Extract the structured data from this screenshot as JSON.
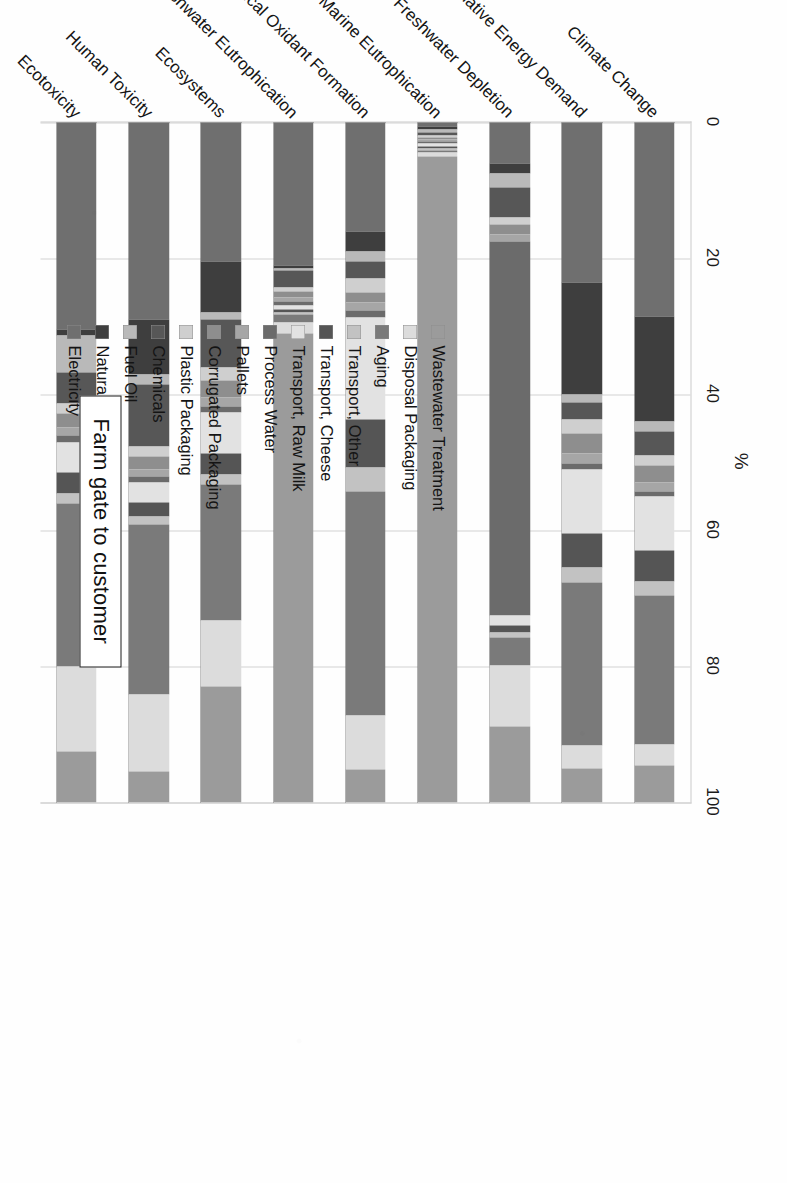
{
  "figure": {
    "title": "Farm gate to customer",
    "axis_title": "%"
  },
  "chart_data": {
    "type": "bar",
    "orientation": "horizontal",
    "stacked": true,
    "normalized_percent": true,
    "title": "Farm gate to customer",
    "xlabel": "%",
    "ylabel": "",
    "xlim": [
      0,
      100
    ],
    "grid": true,
    "legend_position": "bottom",
    "tick_labels": [
      "0",
      "20",
      "40",
      "60",
      "80",
      "100"
    ],
    "tick_values": [
      0,
      20,
      40,
      60,
      80,
      100
    ],
    "categories": [
      "Climate Change",
      "Cumulative Energy Demand",
      "Freshwater Depletion",
      "Marine Eutrophication",
      "Photochemical Oxidant Formation",
      "Freshwater Eutrophication",
      "Ecosystems",
      "Human Toxicity",
      "Ecotoxicity"
    ],
    "series": [
      {
        "name": "Electricity",
        "color": "#6f6f6f",
        "values": [
          28.5,
          23.5,
          6.0,
          0.6,
          16.0,
          21.0,
          20.5,
          29.0,
          30.5
        ]
      },
      {
        "name": "Natural Gas",
        "color": "#3e3e3e",
        "values": [
          15.5,
          16.5,
          1.5,
          0.5,
          3.0,
          0.4,
          7.5,
          8.0,
          0.8
        ]
      },
      {
        "name": "Fuel Oil",
        "color": "#b9b9b9",
        "values": [
          1.5,
          1.2,
          2.0,
          0.4,
          1.5,
          0.3,
          1.0,
          1.6,
          5.5
        ]
      },
      {
        "name": "Chemicals",
        "color": "#575757",
        "values": [
          3.5,
          2.5,
          4.5,
          0.4,
          2.5,
          2.6,
          7.0,
          9.0,
          4.5
        ]
      },
      {
        "name": "Plastic Packaging",
        "color": "#cfcfcf",
        "values": [
          1.5,
          2.0,
          1.0,
          0.3,
          2.0,
          0.5,
          2.0,
          1.5,
          1.5
        ]
      },
      {
        "name": "Corrugated Packaging",
        "color": "#8e8e8e",
        "values": [
          2.5,
          3.0,
          1.5,
          0.3,
          1.5,
          1.0,
          2.5,
          2.0,
          2.0
        ]
      },
      {
        "name": "Pallets",
        "color": "#a6a6a6",
        "values": [
          1.2,
          1.5,
          1.0,
          0.3,
          1.2,
          0.6,
          1.2,
          1.0,
          1.2
        ]
      },
      {
        "name": "Process Water",
        "color": "#6b6b6b",
        "values": [
          0.8,
          0.8,
          55.0,
          0.3,
          1.0,
          0.5,
          1.0,
          0.8,
          1.0
        ]
      },
      {
        "name": "Transport, Raw Milk",
        "color": "#e2e2e2",
        "values": [
          8.0,
          9.5,
          1.5,
          0.4,
          15.0,
          0.6,
          6.0,
          3.0,
          4.5
        ]
      },
      {
        "name": "Transport, Cheese",
        "color": "#555555",
        "values": [
          4.5,
          5.0,
          1.0,
          0.3,
          7.0,
          0.4,
          3.0,
          2.0,
          3.0
        ]
      },
      {
        "name": "Transport, Other",
        "color": "#c2c2c2",
        "values": [
          2.0,
          2.2,
          0.8,
          0.3,
          3.5,
          0.3,
          1.5,
          1.2,
          1.5
        ]
      },
      {
        "name": "Aging",
        "color": "#7a7a7a",
        "values": [
          22.0,
          24.0,
          4.0,
          0.4,
          33.0,
          1.2,
          20.0,
          25.0,
          24.0
        ]
      },
      {
        "name": "Disposal Packaging",
        "color": "#dcdcdc",
        "values": [
          3.0,
          3.3,
          9.0,
          0.5,
          8.0,
          1.6,
          9.8,
          11.4,
          12.5
        ]
      },
      {
        "name": "Wastewater Treatment",
        "color": "#9b9b9b",
        "values": [
          5.5,
          5.0,
          11.2,
          95.5,
          4.8,
          69.0,
          17.0,
          4.5,
          7.5
        ]
      }
    ]
  }
}
